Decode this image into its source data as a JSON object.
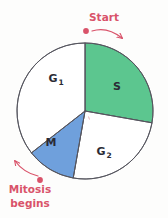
{
  "figure": {
    "background_color": "#fdfdfc"
  },
  "colors": {
    "s_phase_fill": "#5cc68f",
    "m_phase_fill": "#6fa0dc",
    "g_phase_fill": "#ffffff",
    "circle_stroke": "#55555e",
    "annotation": "#d9536a",
    "label_text": "#2b2b35"
  },
  "chart_data": {
    "type": "pie",
    "center": {
      "x": 85,
      "y": 111
    },
    "radius": 68,
    "start_angle_deg": 0,
    "direction": "clockwise",
    "categories": [
      "S",
      "G2",
      "M",
      "G1"
    ],
    "values": [
      100,
      90,
      42,
      128
    ],
    "slices": [
      {
        "label": "S",
        "label_main": "S",
        "label_sub": "",
        "start_deg": 0,
        "end_deg": 100,
        "sweep_deg": 100,
        "fill": "#5cc68f",
        "label_x": 117,
        "label_y": 90
      },
      {
        "label": "G2",
        "label_main": "G",
        "label_sub": "2",
        "start_deg": 100,
        "end_deg": 190,
        "sweep_deg": 90,
        "fill": "#ffffff",
        "label_x": 101,
        "label_y": 155
      },
      {
        "label": "M",
        "label_main": "M",
        "label_sub": "",
        "start_deg": 190,
        "end_deg": 232,
        "sweep_deg": 42,
        "fill": "#6fa0dc",
        "label_x": 51,
        "label_y": 146
      },
      {
        "label": "G1",
        "label_main": "G",
        "label_sub": "1",
        "start_deg": 232,
        "end_deg": 360,
        "sweep_deg": 128,
        "fill": "#ffffff",
        "label_x": 53,
        "label_y": 82
      }
    ],
    "legend": "none",
    "grid": false
  },
  "annotations": {
    "start": {
      "label": "Start",
      "text_x": 104,
      "text_y": 21,
      "dot_x": 86,
      "dot_y": 31,
      "arrow_from_x": 92,
      "arrow_from_y": 31,
      "arrow_to_x": 122,
      "arrow_to_y": 38
    },
    "mitosis": {
      "line1": "Mitosis",
      "line2": "begins",
      "text_x": 30,
      "text_y": 193,
      "dot_x": 40,
      "dot_y": 180,
      "arrow_from_x": 38,
      "arrow_from_y": 176,
      "arrow_to_x": 15,
      "arrow_to_y": 161
    }
  }
}
